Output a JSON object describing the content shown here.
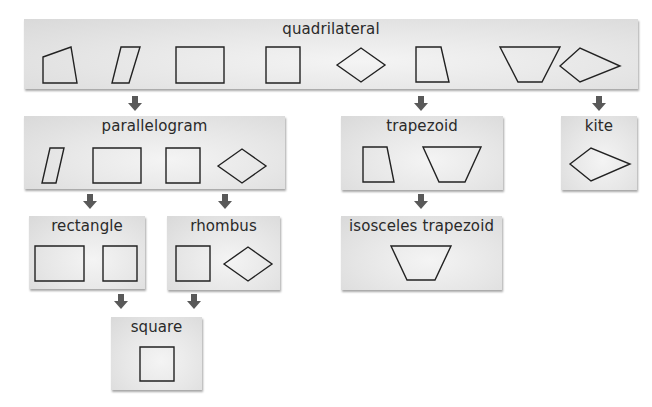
{
  "diagram": {
    "colors": {
      "box_fill": "#e6e6e6",
      "arrow": "#595959",
      "stroke": "#222222",
      "text": "#2a2a2a"
    },
    "nodes": [
      {
        "id": "quadrilateral",
        "label": "quadrilateral",
        "shapes": [
          "quadrilateral",
          "parallelogram",
          "rectangle",
          "square",
          "rhombus",
          "trapezoid",
          "isosceles-trapezoid",
          "kite"
        ]
      },
      {
        "id": "parallelogram",
        "label": "parallelogram",
        "shapes": [
          "parallelogram",
          "rectangle",
          "square",
          "rhombus"
        ]
      },
      {
        "id": "trapezoid",
        "label": "trapezoid",
        "shapes": [
          "trapezoid",
          "isosceles-trapezoid"
        ]
      },
      {
        "id": "kite",
        "label": "kite",
        "shapes": [
          "kite"
        ]
      },
      {
        "id": "rectangle",
        "label": "rectangle",
        "shapes": [
          "rectangle",
          "square"
        ]
      },
      {
        "id": "rhombus",
        "label": "rhombus",
        "shapes": [
          "square",
          "rhombus"
        ]
      },
      {
        "id": "isosceles_trapezoid",
        "label": "isosceles trapezoid",
        "shapes": [
          "isosceles-trapezoid"
        ]
      },
      {
        "id": "square",
        "label": "square",
        "shapes": [
          "square"
        ]
      }
    ],
    "edges": [
      {
        "from": "quadrilateral",
        "to": "parallelogram"
      },
      {
        "from": "quadrilateral",
        "to": "trapezoid"
      },
      {
        "from": "quadrilateral",
        "to": "kite"
      },
      {
        "from": "parallelogram",
        "to": "rectangle"
      },
      {
        "from": "parallelogram",
        "to": "rhombus"
      },
      {
        "from": "trapezoid",
        "to": "isosceles_trapezoid"
      },
      {
        "from": "rectangle",
        "to": "square"
      },
      {
        "from": "rhombus",
        "to": "square"
      }
    ]
  },
  "labels": {
    "quadrilateral": "quadrilateral",
    "parallelogram": "parallelogram",
    "trapezoid": "trapezoid",
    "kite": "kite",
    "rectangle": "rectangle",
    "rhombus": "rhombus",
    "isosceles_trapezoid": "isosceles trapezoid",
    "square": "square"
  }
}
